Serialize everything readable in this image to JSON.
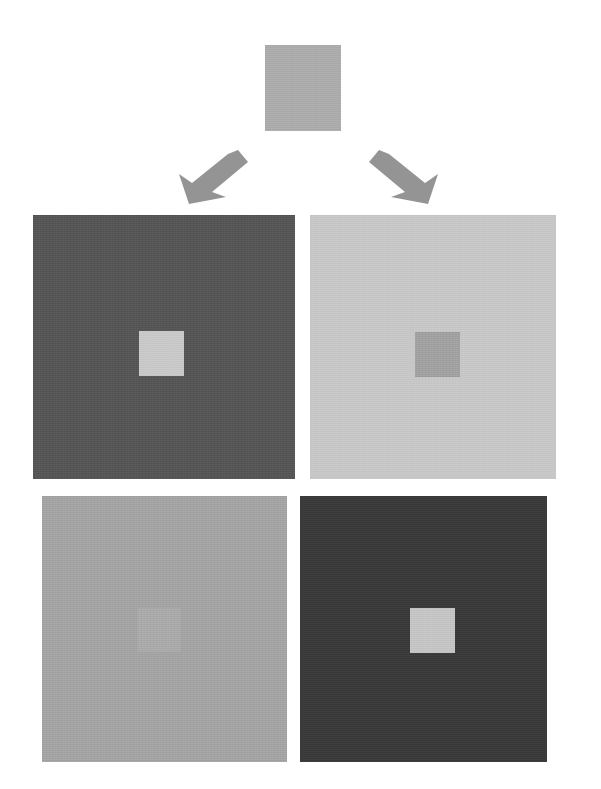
{
  "figure": {
    "type": "simultaneous-brightness-contrast-illusion",
    "canvas": {
      "width": 601,
      "height": 789,
      "background": "#ffffff"
    },
    "source": {
      "name": "source-gray-swatch",
      "color": "#ababab",
      "x": 265,
      "y": 45,
      "width": 76,
      "height": 86
    },
    "arrows": [
      {
        "name": "arrow-down-left",
        "direction": "down-left",
        "color": "#949494",
        "x": 176,
        "y": 148,
        "width": 72,
        "height": 58
      },
      {
        "name": "arrow-down-right",
        "direction": "down-right",
        "color": "#949494",
        "x": 369,
        "y": 148,
        "width": 72,
        "height": 58
      }
    ],
    "panels": [
      {
        "name": "panel-top-left",
        "position": "top-left",
        "background_color": "#555555",
        "x": 33,
        "y": 215,
        "width": 262,
        "height": 264,
        "patch": {
          "name": "center-patch-top-left",
          "color": "#c8c8c8",
          "x": 139,
          "y": 331,
          "width": 45,
          "height": 45
        }
      },
      {
        "name": "panel-top-right",
        "position": "top-right",
        "background_color": "#c6c6c6",
        "x": 310,
        "y": 215,
        "width": 246,
        "height": 264,
        "patch": {
          "name": "center-patch-top-right",
          "color": "#a0a0a0",
          "x": 415,
          "y": 332,
          "width": 45,
          "height": 45
        }
      },
      {
        "name": "panel-bottom-left",
        "position": "bottom-left",
        "background_color": "#a3a3a3",
        "x": 42,
        "y": 496,
        "width": 245,
        "height": 266,
        "patch": {
          "name": "center-patch-bottom-left",
          "color": "#a9a9a9",
          "x": 137,
          "y": 608,
          "width": 44,
          "height": 44
        }
      },
      {
        "name": "panel-bottom-right",
        "position": "bottom-right",
        "background_color": "#3a3a3a",
        "x": 300,
        "y": 496,
        "width": 247,
        "height": 266,
        "patch": {
          "name": "center-patch-bottom-right",
          "color": "#c4c4c4",
          "x": 410,
          "y": 608,
          "width": 45,
          "height": 45
        }
      }
    ]
  }
}
